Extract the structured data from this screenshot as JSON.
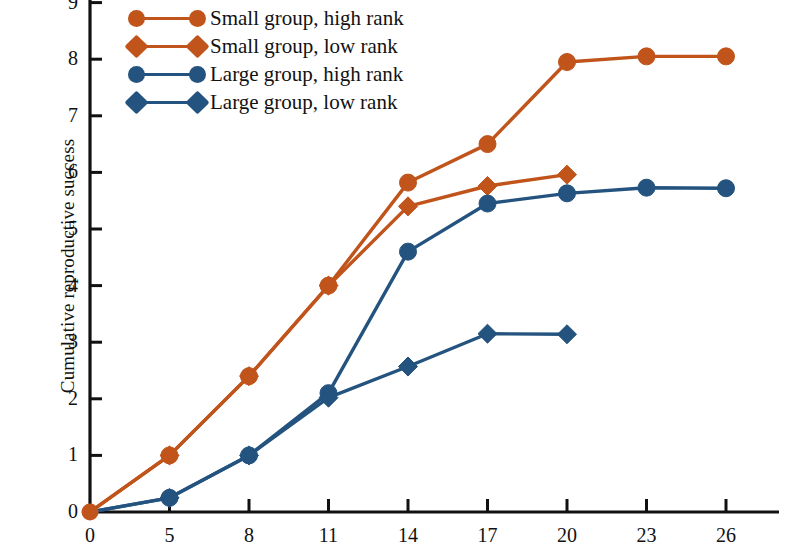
{
  "chart_data": {
    "type": "line",
    "title": "",
    "xlabel": "",
    "ylabel": "Cumulative reproductive success",
    "xlim": [
      0,
      27
    ],
    "ylim": [
      0,
      9
    ],
    "xticks": [
      0,
      5,
      8,
      11,
      14,
      17,
      20,
      23,
      26
    ],
    "yticks": [
      0,
      1,
      2,
      3,
      4,
      5,
      6,
      7,
      8,
      9
    ],
    "xtick_labels": [
      "0",
      "5",
      "8",
      "11",
      "14",
      "17",
      "20",
      "23",
      "26"
    ],
    "ytick_labels": [
      "0",
      "1",
      "2",
      "3",
      "4",
      "5",
      "6",
      "7",
      "8",
      "9"
    ],
    "grid": false,
    "legend_position": "top-left",
    "series": [
      {
        "name": "Small group, high rank",
        "color": "#C0541B",
        "marker": "circle",
        "x": [
          0,
          5,
          8,
          11,
          14,
          17,
          20,
          23,
          26
        ],
        "y": [
          0,
          1.0,
          2.4,
          4.0,
          5.82,
          6.5,
          7.95,
          8.05,
          8.05
        ]
      },
      {
        "name": "Small group, low rank",
        "color": "#C0541B",
        "marker": "diamond",
        "x": [
          0,
          5,
          8,
          11,
          14,
          17,
          20
        ],
        "y": [
          0,
          1.0,
          2.4,
          4.0,
          5.4,
          5.76,
          5.96
        ]
      },
      {
        "name": "Large group, high rank",
        "color": "#23537E",
        "marker": "circle",
        "x": [
          0,
          5,
          8,
          11,
          14,
          17,
          20,
          23,
          26
        ],
        "y": [
          0,
          0.25,
          1.0,
          2.1,
          4.6,
          5.45,
          5.63,
          5.73,
          5.72
        ]
      },
      {
        "name": "Large group, low rank",
        "color": "#23537E",
        "marker": "diamond",
        "x": [
          0,
          5,
          8,
          11,
          14,
          17,
          20
        ],
        "y": [
          0,
          0.25,
          1.0,
          2.02,
          2.57,
          3.15,
          3.14
        ]
      }
    ]
  },
  "legend": {
    "items": [
      {
        "label": "Small group, high rank",
        "color": "#C0541B",
        "marker": "circle"
      },
      {
        "label": "Small group, low rank",
        "color": "#C0541B",
        "marker": "diamond"
      },
      {
        "label": "Large group, high rank",
        "color": "#23537E",
        "marker": "circle"
      },
      {
        "label": "Large group, low rank",
        "color": "#23537E",
        "marker": "diamond"
      }
    ]
  },
  "colors": {
    "orange": "#C0541B",
    "blue": "#23537E",
    "axis": "#111111",
    "background": "#ffffff"
  }
}
